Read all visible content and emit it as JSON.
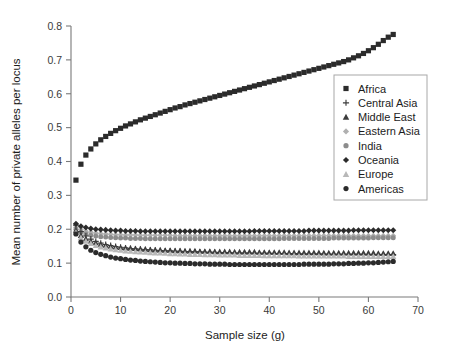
{
  "chart_data": {
    "type": "scatter",
    "title": "",
    "xlabel": "Sample size (g)",
    "ylabel": "Mean number of private alleles per locus",
    "xlim": [
      0,
      70
    ],
    "ylim": [
      0.0,
      0.8
    ],
    "xticks": [
      0,
      10,
      20,
      30,
      40,
      50,
      60,
      70
    ],
    "xticklabels": [
      "0",
      "10",
      "20",
      "30",
      "40",
      "50",
      "60",
      "70"
    ],
    "yticks": [
      0.0,
      0.1,
      0.2,
      0.3,
      0.4,
      0.5,
      0.6,
      0.7,
      0.8
    ],
    "yticklabels": [
      "0.0",
      "0.1",
      "0.2",
      "0.3",
      "0.4",
      "0.5",
      "0.6",
      "0.7",
      "0.8"
    ],
    "grid": false,
    "legend_position": "right-upper",
    "x": [
      1,
      2,
      3,
      4,
      5,
      6,
      7,
      8,
      9,
      10,
      11,
      12,
      13,
      14,
      15,
      16,
      17,
      18,
      19,
      20,
      21,
      22,
      23,
      24,
      25,
      26,
      27,
      28,
      29,
      30,
      31,
      32,
      33,
      34,
      35,
      36,
      37,
      38,
      39,
      40,
      41,
      42,
      43,
      44,
      45,
      46,
      47,
      48,
      49,
      50,
      51,
      52,
      53,
      54,
      55,
      56,
      57,
      58,
      59,
      60,
      61,
      62,
      63,
      64,
      65
    ],
    "series": [
      {
        "name": "Africa",
        "marker": "square",
        "color": "#2b2b2b",
        "size": 5.2,
        "values": [
          0.345,
          0.392,
          0.419,
          0.437,
          0.452,
          0.464,
          0.474,
          0.483,
          0.491,
          0.498,
          0.505,
          0.511,
          0.517,
          0.523,
          0.528,
          0.533,
          0.538,
          0.543,
          0.548,
          0.553,
          0.558,
          0.562,
          0.567,
          0.571,
          0.575,
          0.579,
          0.583,
          0.587,
          0.591,
          0.595,
          0.599,
          0.603,
          0.607,
          0.611,
          0.615,
          0.619,
          0.623,
          0.627,
          0.631,
          0.635,
          0.639,
          0.643,
          0.647,
          0.651,
          0.655,
          0.659,
          0.663,
          0.667,
          0.671,
          0.675,
          0.679,
          0.683,
          0.687,
          0.691,
          0.695,
          0.7,
          0.706,
          0.712,
          0.719,
          0.727,
          0.736,
          0.746,
          0.757,
          0.767,
          0.775
        ]
      },
      {
        "name": "Central Asia",
        "marker": "plus",
        "color": "#3c3c3c",
        "size": 5.0,
        "values": [
          0.212,
          0.193,
          0.18,
          0.171,
          0.164,
          0.159,
          0.155,
          0.152,
          0.149,
          0.147,
          0.145,
          0.143,
          0.142,
          0.141,
          0.14,
          0.139,
          0.138,
          0.137,
          0.136,
          0.136,
          0.135,
          0.135,
          0.134,
          0.134,
          0.133,
          0.133,
          0.132,
          0.132,
          0.132,
          0.131,
          0.131,
          0.131,
          0.13,
          0.13,
          0.13,
          0.13,
          0.129,
          0.129,
          0.129,
          0.129,
          0.128,
          0.128,
          0.128,
          0.128,
          0.128,
          0.127,
          0.127,
          0.127,
          0.127,
          0.127,
          0.127,
          0.126,
          0.126,
          0.126,
          0.126,
          0.126,
          0.126,
          0.126,
          0.126,
          0.125,
          0.125,
          0.125,
          0.125,
          0.125,
          0.125
        ]
      },
      {
        "name": "Middle East",
        "marker": "triangle",
        "color": "#3c3c3c",
        "size": 5.0,
        "values": [
          0.197,
          0.182,
          0.172,
          0.165,
          0.16,
          0.156,
          0.153,
          0.15,
          0.148,
          0.146,
          0.145,
          0.144,
          0.143,
          0.142,
          0.141,
          0.14,
          0.139,
          0.139,
          0.138,
          0.138,
          0.137,
          0.137,
          0.136,
          0.136,
          0.136,
          0.135,
          0.135,
          0.135,
          0.134,
          0.134,
          0.134,
          0.134,
          0.133,
          0.133,
          0.133,
          0.133,
          0.133,
          0.132,
          0.132,
          0.132,
          0.132,
          0.132,
          0.132,
          0.131,
          0.131,
          0.131,
          0.131,
          0.131,
          0.131,
          0.131,
          0.13,
          0.13,
          0.13,
          0.13,
          0.13,
          0.13,
          0.13,
          0.13,
          0.13,
          0.13,
          0.13,
          0.129,
          0.129,
          0.129,
          0.129
        ]
      },
      {
        "name": "Eastern Asia",
        "marker": "diamond",
        "color": "#b0b0b0",
        "size": 5.0,
        "values": [
          0.206,
          0.199,
          0.194,
          0.191,
          0.189,
          0.187,
          0.186,
          0.185,
          0.184,
          0.184,
          0.183,
          0.183,
          0.183,
          0.182,
          0.182,
          0.182,
          0.182,
          0.182,
          0.182,
          0.182,
          0.181,
          0.181,
          0.181,
          0.181,
          0.181,
          0.181,
          0.181,
          0.181,
          0.181,
          0.181,
          0.181,
          0.181,
          0.181,
          0.181,
          0.181,
          0.181,
          0.181,
          0.181,
          0.181,
          0.181,
          0.181,
          0.181,
          0.181,
          0.181,
          0.181,
          0.181,
          0.181,
          0.181,
          0.181,
          0.181,
          0.181,
          0.181,
          0.181,
          0.181,
          0.181,
          0.181,
          0.181,
          0.181,
          0.181,
          0.181,
          0.181,
          0.181,
          0.181,
          0.181,
          0.181
        ]
      },
      {
        "name": "India",
        "marker": "circle",
        "color": "#8c8c8c",
        "size": 5.0,
        "values": [
          0.2,
          0.191,
          0.186,
          0.182,
          0.18,
          0.178,
          0.177,
          0.176,
          0.175,
          0.174,
          0.174,
          0.173,
          0.173,
          0.173,
          0.172,
          0.172,
          0.172,
          0.172,
          0.172,
          0.172,
          0.172,
          0.172,
          0.172,
          0.172,
          0.172,
          0.172,
          0.172,
          0.172,
          0.172,
          0.172,
          0.172,
          0.172,
          0.172,
          0.172,
          0.172,
          0.172,
          0.172,
          0.172,
          0.172,
          0.172,
          0.172,
          0.172,
          0.173,
          0.173,
          0.173,
          0.173,
          0.173,
          0.173,
          0.173,
          0.173,
          0.173,
          0.173,
          0.174,
          0.174,
          0.174,
          0.174,
          0.174,
          0.174,
          0.174,
          0.174,
          0.175,
          0.175,
          0.175,
          0.175,
          0.175
        ]
      },
      {
        "name": "Oceania",
        "marker": "diamond",
        "color": "#2b2b2b",
        "size": 5.2,
        "values": [
          0.216,
          0.209,
          0.205,
          0.202,
          0.2,
          0.199,
          0.198,
          0.197,
          0.196,
          0.196,
          0.195,
          0.195,
          0.195,
          0.194,
          0.194,
          0.194,
          0.194,
          0.194,
          0.194,
          0.194,
          0.194,
          0.194,
          0.194,
          0.194,
          0.194,
          0.194,
          0.194,
          0.194,
          0.194,
          0.194,
          0.194,
          0.194,
          0.194,
          0.194,
          0.194,
          0.194,
          0.195,
          0.195,
          0.195,
          0.195,
          0.195,
          0.195,
          0.195,
          0.195,
          0.195,
          0.195,
          0.195,
          0.196,
          0.196,
          0.196,
          0.196,
          0.196,
          0.196,
          0.196,
          0.196,
          0.196,
          0.197,
          0.197,
          0.197,
          0.197,
          0.197,
          0.197,
          0.197,
          0.197,
          0.197
        ]
      },
      {
        "name": "Europe",
        "marker": "triangle",
        "color": "#b8b8b8",
        "size": 5.0,
        "values": [
          0.191,
          0.175,
          0.165,
          0.158,
          0.152,
          0.148,
          0.145,
          0.142,
          0.14,
          0.138,
          0.136,
          0.135,
          0.134,
          0.133,
          0.132,
          0.131,
          0.13,
          0.13,
          0.129,
          0.128,
          0.128,
          0.127,
          0.127,
          0.126,
          0.126,
          0.126,
          0.125,
          0.125,
          0.125,
          0.124,
          0.124,
          0.124,
          0.124,
          0.123,
          0.123,
          0.123,
          0.123,
          0.123,
          0.122,
          0.122,
          0.122,
          0.122,
          0.122,
          0.122,
          0.122,
          0.121,
          0.121,
          0.121,
          0.121,
          0.121,
          0.121,
          0.121,
          0.121,
          0.121,
          0.121,
          0.12,
          0.12,
          0.12,
          0.12,
          0.12,
          0.12,
          0.12,
          0.12,
          0.12,
          0.12
        ]
      },
      {
        "name": "Americas",
        "marker": "circle",
        "color": "#2b2b2b",
        "size": 5.2,
        "values": [
          0.186,
          0.162,
          0.148,
          0.138,
          0.131,
          0.126,
          0.122,
          0.118,
          0.115,
          0.113,
          0.111,
          0.109,
          0.108,
          0.106,
          0.105,
          0.104,
          0.103,
          0.102,
          0.101,
          0.101,
          0.1,
          0.1,
          0.099,
          0.099,
          0.098,
          0.098,
          0.098,
          0.097,
          0.097,
          0.097,
          0.097,
          0.096,
          0.096,
          0.096,
          0.096,
          0.096,
          0.096,
          0.096,
          0.096,
          0.096,
          0.096,
          0.096,
          0.096,
          0.096,
          0.096,
          0.096,
          0.097,
          0.097,
          0.097,
          0.097,
          0.097,
          0.097,
          0.098,
          0.098,
          0.098,
          0.099,
          0.099,
          0.1,
          0.1,
          0.101,
          0.101,
          0.102,
          0.103,
          0.104,
          0.105
        ]
      }
    ]
  },
  "legend": {
    "entries": [
      {
        "label": "Africa",
        "marker": "square",
        "color": "#2b2b2b"
      },
      {
        "label": "Central Asia",
        "marker": "plus",
        "color": "#3c3c3c"
      },
      {
        "label": "Middle East",
        "marker": "triangle",
        "color": "#3c3c3c"
      },
      {
        "label": "Eastern Asia",
        "marker": "diamond",
        "color": "#b0b0b0"
      },
      {
        "label": "India",
        "marker": "circle",
        "color": "#8c8c8c"
      },
      {
        "label": "Oceania",
        "marker": "diamond",
        "color": "#2b2b2b"
      },
      {
        "label": "Europe",
        "marker": "triangle",
        "color": "#b8b8b8"
      },
      {
        "label": "Americas",
        "marker": "circle",
        "color": "#2b2b2b"
      }
    ]
  },
  "colors": {
    "axis": "#7a7a7a",
    "text": "#1c1c1c",
    "ticktext": "#3a3a3a",
    "legend_border": "#a8a8a8",
    "background": "#ffffff"
  }
}
